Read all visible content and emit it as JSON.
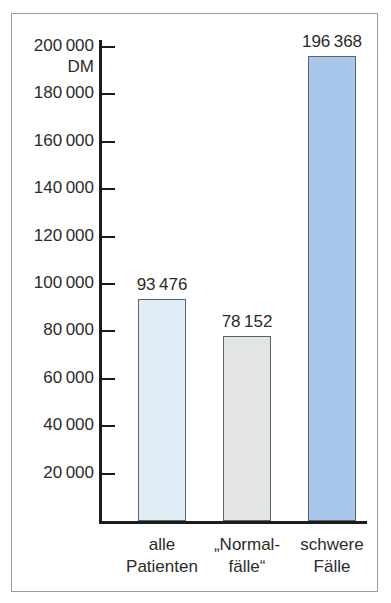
{
  "chart_data": {
    "type": "bar",
    "title": "",
    "subtitle": "",
    "xlabel": "",
    "ylabel": "DM",
    "unit_label": "DM",
    "categories": [
      "alle Patienten",
      "„Normal-fälle“",
      "schwere Fälle"
    ],
    "category_lines": [
      [
        "alle",
        "Patienten"
      ],
      [
        "„Normal-",
        "fälle“"
      ],
      [
        "schwere",
        "Fälle"
      ]
    ],
    "values": [
      93476,
      78152,
      196368
    ],
    "value_labels": [
      "93 476",
      "78 152",
      "196 368"
    ],
    "ylim": [
      0,
      200000
    ],
    "ytick_values": [
      20000,
      40000,
      60000,
      80000,
      100000,
      120000,
      140000,
      160000,
      180000,
      200000
    ],
    "ytick_labels": [
      "20 000",
      "40 000",
      "60 000",
      "80 000",
      "100 000",
      "120 000",
      "140 000",
      "160 000",
      "180 000",
      "200 000"
    ],
    "grid": false,
    "legend": "none",
    "bar_colors": [
      "#dfecf4",
      "#e3e5e4",
      "#a9c7ea"
    ],
    "bar_border_color": "#5a6370",
    "axis_color": "#1c1c1c",
    "text_color": "#2b2b2b",
    "frame_color": "#9a9a9a",
    "background": "#ffffff"
  }
}
